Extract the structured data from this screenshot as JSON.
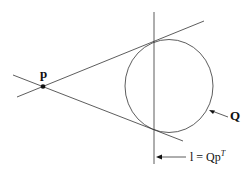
{
  "diagram": {
    "point_label": "p",
    "conic_label": "Q",
    "polar_line_label_prefix": "l = Qp",
    "polar_line_label_superscript": "T",
    "stroke_color": "#333333"
  }
}
